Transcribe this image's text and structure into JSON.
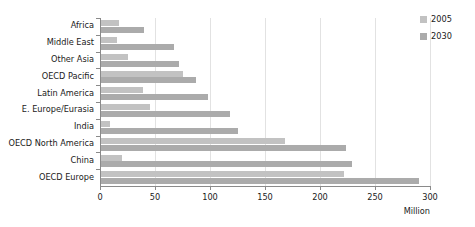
{
  "chart_data": {
    "type": "bar",
    "orientation": "horizontal",
    "title": "",
    "xlabel": "Million",
    "ylabel": "",
    "xlim": [
      0,
      300
    ],
    "xticks": [
      0,
      50,
      100,
      150,
      200,
      250,
      300
    ],
    "grid": true,
    "legend_position": "right",
    "categories": [
      "Africa",
      "Middle East",
      "Other Asia",
      "OECD Pacific",
      "Latin America",
      "E. Europe/Eurasia",
      "India",
      "OECD North America",
      "China",
      "OECD Europe"
    ],
    "series": [
      {
        "name": "2005",
        "color": "#c2c2c2",
        "values": [
          17,
          15,
          25,
          75,
          39,
          45,
          9,
          168,
          20,
          222
        ]
      },
      {
        "name": "2030",
        "color": "#ababab",
        "values": [
          40,
          67,
          72,
          87,
          98,
          118,
          125,
          224,
          229,
          290
        ]
      }
    ]
  },
  "axis": {
    "unit_label": "Million"
  },
  "legend": {
    "items": [
      {
        "label": "2005",
        "color": "#c2c2c2"
      },
      {
        "label": "2030",
        "color": "#ababab"
      }
    ]
  },
  "colors": {
    "axis": "#8a8a8a",
    "grid": "#e2e2e2",
    "text": "#1a1a1a",
    "background": "#ffffff"
  }
}
